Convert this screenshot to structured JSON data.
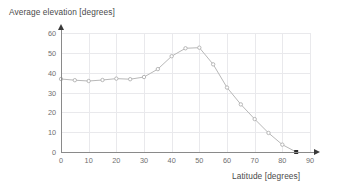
{
  "chart_data": {
    "type": "line",
    "title": "Average elevation [degrees]",
    "xlabel": "Latitude [degrees]",
    "ylabel": "Average elevation [degrees]",
    "xlim": [
      0,
      90
    ],
    "ylim": [
      0,
      60
    ],
    "xticks": [
      0,
      10,
      20,
      30,
      40,
      50,
      60,
      70,
      80,
      90
    ],
    "yticks": [
      0,
      10,
      20,
      30,
      40,
      50,
      60
    ],
    "grid": true,
    "legend": "none",
    "series": [
      {
        "name": "Average elevation",
        "marker": "circle",
        "color": "#b8b8b8",
        "x": [
          0,
          5,
          10,
          15,
          20,
          25,
          30,
          35,
          40,
          45,
          50,
          55,
          60,
          65,
          70,
          75,
          80,
          85
        ],
        "values": [
          36.8,
          36.2,
          35.8,
          36.3,
          37.0,
          36.7,
          37.8,
          41.8,
          48.3,
          52.3,
          52.6,
          44.2,
          32.5,
          24.0,
          16.6,
          9.6,
          3.7,
          0.0
        ]
      }
    ]
  }
}
